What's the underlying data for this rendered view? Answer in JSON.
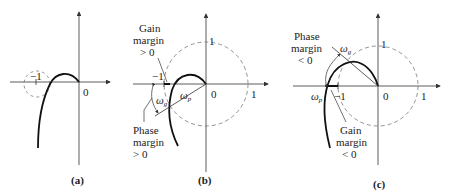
{
  "figure": {
    "panels": [
      {
        "id": "a",
        "caption": "(a)",
        "labels": {
          "minus_one": "−1",
          "origin": "0"
        }
      },
      {
        "id": "b",
        "caption": "(b)",
        "labels": {
          "minus_one": "−1",
          "origin": "0",
          "one_x": "1",
          "one_y": "1",
          "gain_margin_line1": "Gain",
          "gain_margin_line2": "margin",
          "gain_margin_line3": "> 0",
          "phase_margin_line1": "Phase",
          "phase_margin_line2": "margin",
          "phase_margin_line3": "> 0",
          "omega_g": "ω",
          "omega_g_sub": "g",
          "omega_p": "ω",
          "omega_p_sub": "p"
        }
      },
      {
        "id": "c",
        "caption": "(c)",
        "labels": {
          "minus_one": "−1",
          "origin": "0",
          "one_x": "1",
          "one_y": "1",
          "phase_margin_line1": "Phase",
          "phase_margin_line2": "margin",
          "phase_margin_line3": "< 0",
          "gain_margin_line1": "Gain",
          "gain_margin_line2": "margin",
          "gain_margin_line3": "< 0",
          "omega_g": "ω",
          "omega_g_sub": "g",
          "omega_p": "ω",
          "omega_p_sub": "p"
        }
      }
    ],
    "colors": {
      "line": "#111111",
      "dashed": "#777777",
      "axis": "#333333"
    }
  }
}
